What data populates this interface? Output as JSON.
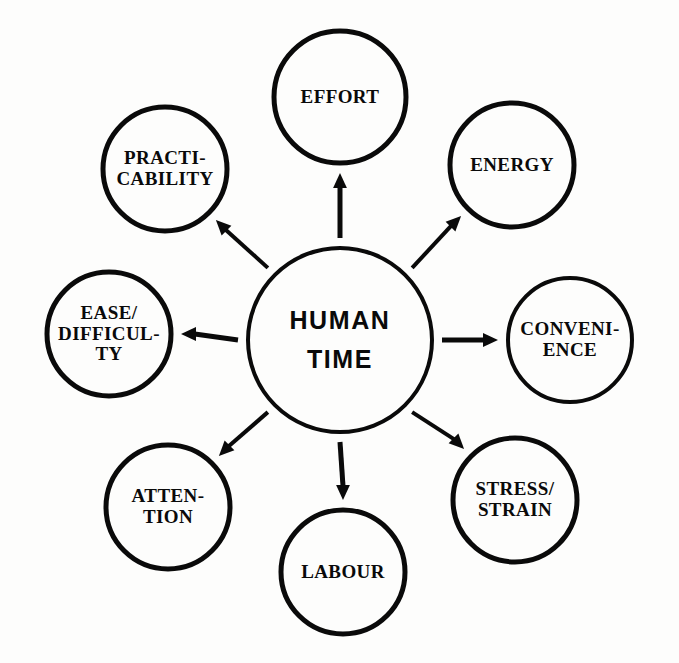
{
  "diagram": {
    "type": "radial-hub-and-spoke",
    "background_color": "#fdfdfc",
    "stroke_color": "#0a0a0a",
    "center": {
      "id": "human-time",
      "lines": [
        "HUMAN",
        "TIME"
      ],
      "cx": 340,
      "cy": 340,
      "r": 92,
      "stroke_width": 4
    },
    "satellites": [
      {
        "id": "effort",
        "lines": [
          "EFFORT"
        ],
        "cx": 340,
        "cy": 97,
        "r": 66,
        "stroke_width": 5,
        "angle_deg": -90
      },
      {
        "id": "energy",
        "lines": [
          "ENERGY"
        ],
        "cx": 512,
        "cy": 165,
        "r": 62,
        "stroke_width": 5,
        "angle_deg": -45
      },
      {
        "id": "convenience",
        "lines": [
          "CONVENI-",
          "ENCE"
        ],
        "cx": 570,
        "cy": 340,
        "r": 62,
        "stroke_width": 4,
        "angle_deg": 0
      },
      {
        "id": "stress-strain",
        "lines": [
          "STRESS/",
          "STRAIN"
        ],
        "cx": 515,
        "cy": 500,
        "r": 62,
        "stroke_width": 5,
        "angle_deg": 45
      },
      {
        "id": "labour",
        "lines": [
          "LABOUR"
        ],
        "cx": 343,
        "cy": 572,
        "r": 62,
        "stroke_width": 5,
        "angle_deg": 90
      },
      {
        "id": "attention",
        "lines": [
          "ATTEN-",
          "TION"
        ],
        "cx": 168,
        "cy": 507,
        "r": 62,
        "stroke_width": 5,
        "angle_deg": 135
      },
      {
        "id": "ease-difficulty",
        "lines": [
          "EASE/",
          "DIFFICUL-",
          "TY"
        ],
        "cx": 109,
        "cy": 334,
        "r": 62,
        "stroke_width": 5,
        "angle_deg": 180
      },
      {
        "id": "practicability",
        "lines": [
          "PRACTI-",
          "CABILITY"
        ],
        "cx": 165,
        "cy": 169,
        "r": 62,
        "stroke_width": 5,
        "angle_deg": -135
      }
    ],
    "arrows": [
      {
        "id": "arrow-to-effort",
        "from": "human-time",
        "to": "effort",
        "angle_deg": -90,
        "width": 5
      },
      {
        "id": "arrow-to-energy",
        "from": "human-time",
        "to": "energy",
        "angle_deg": -45,
        "width": 4
      },
      {
        "id": "arrow-to-convenience",
        "from": "human-time",
        "to": "convenience",
        "angle_deg": 0,
        "width": 5
      },
      {
        "id": "arrow-to-stress-strain",
        "from": "human-time",
        "to": "stress-strain",
        "angle_deg": 45,
        "width": 4
      },
      {
        "id": "arrow-to-labour",
        "from": "human-time",
        "to": "labour",
        "angle_deg": 90,
        "width": 5
      },
      {
        "id": "arrow-to-attention",
        "from": "human-time",
        "to": "attention",
        "angle_deg": 135,
        "width": 4
      },
      {
        "id": "arrow-to-ease-difficulty",
        "from": "human-time",
        "to": "ease-difficulty",
        "angle_deg": 180,
        "width": 5
      },
      {
        "id": "arrow-to-practicability",
        "from": "human-time",
        "to": "practicability",
        "angle_deg": -135,
        "width": 4
      }
    ]
  }
}
